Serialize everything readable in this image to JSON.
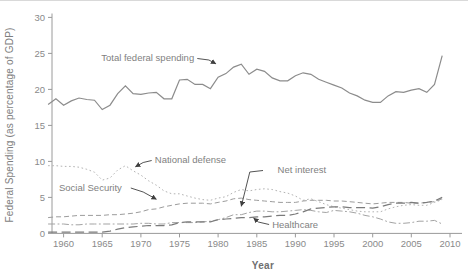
{
  "chart_data": {
    "type": "line",
    "title": "",
    "xlabel": "Year",
    "ylabel": "Federal Spending (as percentage of GDP)",
    "xlim": [
      1958.5,
      2011.3
    ],
    "ylim": [
      0,
      30
    ],
    "x_ticks": [
      1960,
      1965,
      1970,
      1975,
      1980,
      1985,
      1990,
      1995,
      2000,
      2005,
      2010
    ],
    "y_ticks": [
      0,
      5,
      10,
      15,
      20,
      25,
      30
    ],
    "grid": false,
    "legend": "inline-annotations",
    "axis_color": "#9a9a9a",
    "tick_label_color": "#8a8a8a",
    "annotation_text_color": "#7f7f7f",
    "arrow_color": "#3f3f3f",
    "years": [
      1958,
      1959,
      1960,
      1961,
      1962,
      1963,
      1964,
      1965,
      1966,
      1967,
      1968,
      1969,
      1970,
      1971,
      1972,
      1973,
      1974,
      1975,
      1976,
      1977,
      1978,
      1979,
      1980,
      1981,
      1982,
      1983,
      1984,
      1985,
      1986,
      1987,
      1988,
      1989,
      1990,
      1991,
      1992,
      1993,
      1994,
      1995,
      1996,
      1997,
      1998,
      1999,
      2000,
      2001,
      2002,
      2003,
      2004,
      2005,
      2006,
      2007,
      2008,
      2009
    ],
    "series": [
      {
        "name": "Total federal spending",
        "style": "solid",
        "color": "#8c8c8c",
        "values": [
          17.9,
          18.7,
          17.8,
          18.4,
          18.8,
          18.6,
          18.5,
          17.2,
          17.8,
          19.4,
          20.5,
          19.4,
          19.3,
          19.5,
          19.6,
          18.7,
          18.7,
          21.3,
          21.4,
          20.7,
          20.7,
          20.1,
          21.7,
          22.2,
          23.1,
          23.5,
          22.1,
          22.8,
          22.5,
          21.6,
          21.2,
          21.2,
          21.9,
          22.3,
          22.1,
          21.4,
          21.0,
          20.6,
          20.2,
          19.5,
          19.1,
          18.5,
          18.2,
          18.2,
          19.1,
          19.7,
          19.6,
          19.9,
          20.1,
          19.6,
          20.7,
          24.7
        ]
      },
      {
        "name": "National defense",
        "style": "dotted",
        "color": "#b3b3b3",
        "values": [
          9.4,
          9.4,
          9.3,
          9.3,
          9.2,
          8.9,
          8.5,
          7.4,
          7.7,
          8.8,
          9.4,
          8.7,
          8.1,
          7.3,
          6.7,
          5.9,
          5.5,
          5.5,
          5.2,
          4.9,
          4.7,
          4.6,
          4.9,
          5.1,
          5.7,
          6.1,
          5.9,
          6.1,
          6.2,
          6.1,
          5.8,
          5.6,
          5.2,
          4.6,
          4.8,
          4.4,
          4.0,
          3.7,
          3.5,
          3.3,
          3.1,
          3.0,
          3.0,
          3.0,
          3.4,
          3.7,
          3.9,
          4.0,
          3.9,
          3.9,
          4.3,
          4.7
        ]
      },
      {
        "name": "Social Security",
        "style": "dashed",
        "color": "#9c9c9c",
        "values": [
          2.2,
          2.3,
          2.3,
          2.4,
          2.5,
          2.5,
          2.5,
          2.5,
          2.6,
          2.6,
          2.7,
          2.8,
          3.0,
          3.3,
          3.4,
          3.7,
          3.9,
          4.1,
          4.2,
          4.2,
          4.2,
          4.1,
          4.3,
          4.5,
          4.8,
          4.9,
          4.7,
          4.6,
          4.5,
          4.4,
          4.3,
          4.3,
          4.3,
          4.5,
          4.6,
          4.6,
          4.6,
          4.5,
          4.5,
          4.4,
          4.3,
          4.2,
          4.1,
          4.2,
          4.3,
          4.3,
          4.3,
          4.2,
          4.2,
          4.3,
          4.4,
          4.8
        ]
      },
      {
        "name": "Net interest",
        "style": "dash-dot",
        "color": "#a3a3a3",
        "values": [
          1.3,
          1.3,
          1.3,
          1.2,
          1.2,
          1.3,
          1.3,
          1.3,
          1.3,
          1.3,
          1.3,
          1.3,
          1.4,
          1.4,
          1.3,
          1.3,
          1.5,
          1.5,
          1.5,
          1.5,
          1.6,
          1.7,
          1.9,
          2.2,
          2.6,
          2.6,
          2.9,
          3.1,
          3.1,
          3.0,
          3.0,
          3.1,
          3.2,
          3.3,
          3.2,
          3.0,
          2.9,
          3.2,
          3.1,
          3.0,
          2.8,
          2.5,
          2.3,
          2.0,
          1.6,
          1.4,
          1.4,
          1.5,
          1.7,
          1.7,
          1.8,
          1.3
        ]
      },
      {
        "name": "Healthcare",
        "style": "long-dash",
        "color": "#7b7b7b",
        "values": [
          0.2,
          0.2,
          0.2,
          0.2,
          0.2,
          0.2,
          0.2,
          0.2,
          0.3,
          0.6,
          0.8,
          0.9,
          1.0,
          1.1,
          1.1,
          1.1,
          1.2,
          1.5,
          1.6,
          1.6,
          1.6,
          1.6,
          1.9,
          2.0,
          2.1,
          2.2,
          2.2,
          2.3,
          2.3,
          2.4,
          2.5,
          2.5,
          2.7,
          3.0,
          3.4,
          3.5,
          3.6,
          3.7,
          3.7,
          3.6,
          3.6,
          3.6,
          3.5,
          3.7,
          4.0,
          4.2,
          4.2,
          4.3,
          4.2,
          4.3,
          4.5,
          5.0
        ]
      }
    ],
    "annotations": [
      {
        "label": "Total federal spending",
        "anchor": "end",
        "label_pos": {
          "year": 1976.9,
          "value": 24.35
        },
        "arrow": [
          [
            1977.3,
            24.29
          ],
          [
            1978.8,
            24.08
          ],
          [
            1979.7,
            23.55
          ]
        ]
      },
      {
        "label": "National defense",
        "anchor": "start",
        "label_pos": {
          "year": 1971.8,
          "value": 10.19
        },
        "arrow": [
          [
            1971.4,
            10.12
          ],
          [
            1970.3,
            9.85
          ],
          [
            1969.3,
            9.25
          ]
        ]
      },
      {
        "label": "Social Security",
        "anchor": "start",
        "label_pos": {
          "year": 1959.4,
          "value": 6.3
        },
        "arrow": [
          [
            1968.7,
            6.31
          ],
          [
            1970.3,
            5.75
          ],
          [
            1972.0,
            4.75
          ]
        ]
      },
      {
        "label": "Net interest",
        "anchor": "start",
        "label_pos": {
          "year": 1987.7,
          "value": 8.81
        },
        "arrow": [
          [
            1985.8,
            8.74
          ],
          [
            1984.1,
            8.53
          ],
          [
            1983.0,
            3.78
          ]
        ]
      },
      {
        "label": "Healthcare",
        "anchor": "start",
        "label_pos": {
          "year": 1987.0,
          "value": 1.17
        },
        "arrow": [
          [
            1986.6,
            1.24
          ],
          [
            1985.2,
            1.58
          ],
          [
            1984.6,
            2.12
          ]
        ]
      }
    ]
  }
}
